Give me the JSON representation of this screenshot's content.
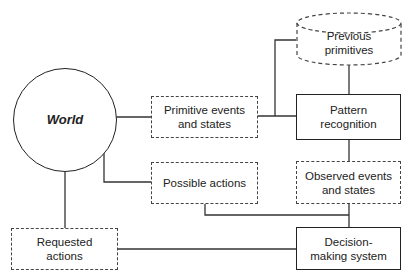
{
  "diagram": {
    "nodes": {
      "world": {
        "label": "World",
        "shape": "circle"
      },
      "primitive_events": {
        "label": "Primitive events and states",
        "line1": "Primitive events",
        "line2": "and states",
        "shape": "dashed-box"
      },
      "previous_primitives": {
        "label": "Previous primitives",
        "line1": "Previous",
        "line2": "primitives",
        "shape": "dashed-cylinder"
      },
      "pattern_recognition": {
        "label": "Pattern recognition",
        "line1": "Pattern",
        "line2": "recognition",
        "shape": "solid-box"
      },
      "possible_actions": {
        "label": "Possible actions",
        "shape": "dashed-box"
      },
      "observed_events": {
        "label": "Observed events and states",
        "line1": "Observed events",
        "line2": "and states",
        "shape": "dashed-box"
      },
      "requested_actions": {
        "label": "Requested actions",
        "line1": "Requested",
        "line2": "actions",
        "shape": "dashed-box"
      },
      "decision_making": {
        "label": "Decision-making system",
        "line1": "Decision-",
        "line2": "making system",
        "shape": "solid-box"
      }
    },
    "edges": [
      [
        "world",
        "primitive_events"
      ],
      [
        "primitive_events",
        "pattern_recognition"
      ],
      [
        "primitive_events",
        "previous_primitives"
      ],
      [
        "previous_primitives",
        "pattern_recognition"
      ],
      [
        "pattern_recognition",
        "observed_events"
      ],
      [
        "world",
        "possible_actions"
      ],
      [
        "possible_actions",
        "decision_making"
      ],
      [
        "observed_events",
        "decision_making"
      ],
      [
        "world",
        "requested_actions"
      ],
      [
        "requested_actions",
        "decision_making"
      ]
    ]
  }
}
